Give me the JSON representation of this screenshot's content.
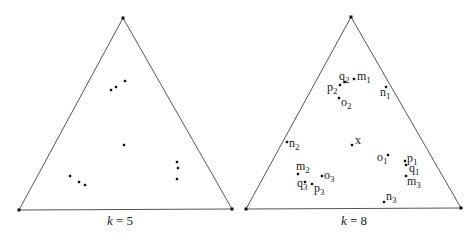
{
  "colors": {
    "stroke": "#555555",
    "point": "#111111",
    "text": "#222222",
    "background": "#ffffff"
  },
  "panels": [
    {
      "id": "k5",
      "caption": {
        "var": "k",
        "eq": " = ",
        "val": "5",
        "x": 120,
        "y": 225
      },
      "triangle": [
        [
          123,
          18
        ],
        [
          19,
          210
        ],
        [
          232,
          209
        ]
      ],
      "points": [
        {
          "x": 111,
          "y": 90,
          "label": ""
        },
        {
          "x": 116,
          "y": 87,
          "label": ""
        },
        {
          "x": 125,
          "y": 81,
          "label": ""
        },
        {
          "x": 124,
          "y": 145,
          "label": ""
        },
        {
          "x": 177,
          "y": 162,
          "label": ""
        },
        {
          "x": 178,
          "y": 168,
          "label": ""
        },
        {
          "x": 177,
          "y": 179,
          "label": ""
        },
        {
          "x": 70,
          "y": 176,
          "label": ""
        },
        {
          "x": 79,
          "y": 182,
          "label": ""
        },
        {
          "x": 85,
          "y": 185,
          "label": ""
        }
      ]
    },
    {
      "id": "k8",
      "caption": {
        "var": "k",
        "eq": " = ",
        "val": "8",
        "x": 354,
        "y": 225
      },
      "triangle": [
        [
          351,
          17
        ],
        [
          246,
          209
        ],
        [
          461,
          208
        ]
      ],
      "points": [
        {
          "x": 354,
          "y": 79,
          "label": "m",
          "sub": "1",
          "lx": 357,
          "ly": 80
        },
        {
          "x": 345,
          "y": 82,
          "label": "q",
          "sub": "2",
          "lx": 339,
          "ly": 80,
          "anchor": "end-ish"
        },
        {
          "x": 340,
          "y": 85,
          "label": "p",
          "sub": "2",
          "lx": 327,
          "ly": 91
        },
        {
          "x": 339,
          "y": 98,
          "label": "o",
          "sub": "2",
          "lx": 341,
          "ly": 106
        },
        {
          "x": 386,
          "y": 87,
          "label": "n",
          "sub": "1",
          "lx": 380,
          "ly": 96
        },
        {
          "x": 287,
          "y": 142,
          "label": "n",
          "sub": "2",
          "lx": 289,
          "ly": 147
        },
        {
          "x": 352,
          "y": 145,
          "label": "x",
          "sub": "",
          "lx": 355,
          "ly": 144
        },
        {
          "x": 298,
          "y": 174,
          "label": "m",
          "sub": "2",
          "lx": 296,
          "ly": 170
        },
        {
          "x": 305,
          "y": 182,
          "label": "q",
          "sub": "3",
          "lx": 297,
          "ly": 187
        },
        {
          "x": 312,
          "y": 184,
          "label": "p",
          "sub": "3",
          "lx": 314,
          "ly": 192
        },
        {
          "x": 322,
          "y": 176,
          "label": "o",
          "sub": "3",
          "lx": 324,
          "ly": 179
        },
        {
          "x": 388,
          "y": 155,
          "label": "o",
          "sub": "1",
          "lx": 377,
          "ly": 161
        },
        {
          "x": 405,
          "y": 161,
          "label": "p",
          "sub": "1",
          "lx": 407,
          "ly": 162
        },
        {
          "x": 406,
          "y": 165,
          "label": "q",
          "sub": "1",
          "lx": 409,
          "ly": 172
        },
        {
          "x": 406,
          "y": 176,
          "label": "m",
          "sub": "3",
          "lx": 407,
          "ly": 185
        },
        {
          "x": 384,
          "y": 202,
          "label": "n",
          "sub": "3",
          "lx": 386,
          "ly": 200
        }
      ]
    }
  ]
}
